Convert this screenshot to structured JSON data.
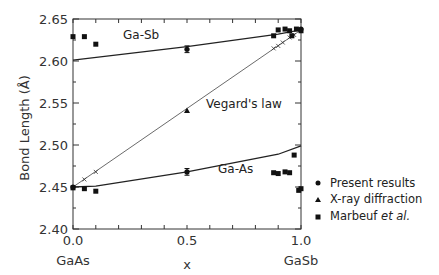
{
  "chart_data": {
    "type": "scatter",
    "title": "",
    "xlabel": "x",
    "ylabel": "Bond Length (Å)",
    "xlim": [
      0.0,
      1.0
    ],
    "ylim": [
      2.4,
      2.65
    ],
    "x_ticks": [
      "0.0",
      "0.5",
      "1.0"
    ],
    "x_tick_sublabels": {
      "0.0": "GaAs",
      "1.0": "GaSb"
    },
    "y_ticks": [
      "2.40",
      "2.45",
      "2.50",
      "2.55",
      "2.60",
      "2.65"
    ],
    "grid": false,
    "legend_position": "right",
    "legend": [
      {
        "marker": "circle",
        "label": "Present results",
        "label_emphasis": ""
      },
      {
        "marker": "triangle",
        "label": "X-ray diffraction",
        "label_emphasis": ""
      },
      {
        "marker": "square",
        "label": "Marbeuf ",
        "label_emphasis": "et al."
      }
    ],
    "annotations": [
      "Ga-Sb",
      "Vegard's law",
      "Ga-As"
    ],
    "series": [
      {
        "name": "Ga-Sb (theory curve)",
        "style": "line",
        "x": [
          0.0,
          0.5,
          0.9,
          1.0
        ],
        "y": [
          2.601,
          2.617,
          2.632,
          2.637
        ]
      },
      {
        "name": "Ga-As (theory curve)",
        "style": "line",
        "x": [
          0.0,
          0.1,
          0.5,
          0.9,
          1.0
        ],
        "y": [
          2.45,
          2.451,
          2.468,
          2.489,
          2.499
        ]
      },
      {
        "name": "Vegard's law",
        "style": "thin-line-with-x",
        "x": [
          0.0,
          1.0
        ],
        "y": [
          2.45,
          2.637
        ],
        "x_markers_x": [
          0.05,
          0.1,
          0.88,
          0.9,
          0.92,
          0.95,
          0.97
        ],
        "x_markers_y": [
          2.459,
          2.468,
          2.615,
          2.618,
          2.622,
          2.628,
          2.631
        ]
      },
      {
        "name": "Present results",
        "marker": "circle",
        "x": [
          0.0,
          0.5,
          0.5,
          1.0
        ],
        "y": [
          2.45,
          2.468,
          2.614,
          2.638
        ],
        "error": [
          0.0,
          0.004,
          0.004,
          0.0
        ]
      },
      {
        "name": "X-ray diffraction",
        "marker": "triangle",
        "x": [
          0.5
        ],
        "y": [
          2.541
        ]
      },
      {
        "name": "Marbeuf et al. (Ga-Sb)",
        "marker": "square",
        "x": [
          0.0,
          0.05,
          0.1,
          0.88,
          0.9,
          0.93,
          0.95,
          0.96,
          0.98,
          1.0
        ],
        "y": [
          2.629,
          2.629,
          2.62,
          2.63,
          2.637,
          2.638,
          2.636,
          2.63,
          2.638,
          2.636
        ]
      },
      {
        "name": "Marbeuf et al. (Ga-As)",
        "marker": "square",
        "x": [
          0.0,
          0.05,
          0.1,
          0.88,
          0.9,
          0.93,
          0.95,
          0.97,
          0.99,
          1.0
        ],
        "y": [
          2.449,
          2.448,
          2.445,
          2.467,
          2.466,
          2.468,
          2.467,
          2.488,
          2.446,
          2.448
        ]
      }
    ]
  }
}
